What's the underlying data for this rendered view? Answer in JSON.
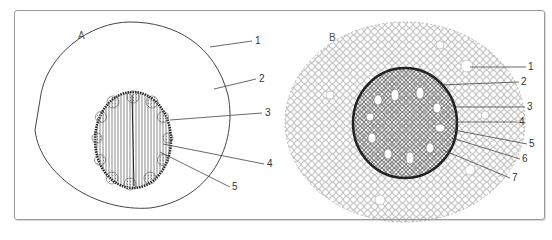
{
  "figure": {
    "panels": [
      {
        "id": "A",
        "label": "A",
        "callouts": [
          "1",
          "2",
          "3",
          "4",
          "5"
        ]
      },
      {
        "id": "B",
        "label": "B",
        "callouts": [
          "1",
          "2",
          "3",
          "4",
          "5",
          "6",
          "7"
        ]
      }
    ],
    "caption_partial": "",
    "colors": {
      "line": "#444444",
      "frame": "#9a9a9a",
      "stipple": "#777777"
    }
  }
}
